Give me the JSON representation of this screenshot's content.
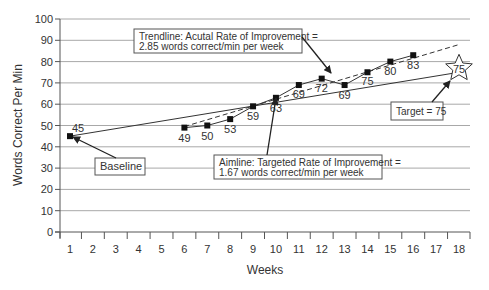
{
  "chart_data": {
    "type": "line",
    "title": "",
    "xlabel": "Weeks",
    "ylabel": "Words Correct Per Min",
    "ylim": [
      0,
      100
    ],
    "yticks": [
      0,
      10,
      20,
      30,
      40,
      50,
      60,
      70,
      80,
      90,
      100
    ],
    "xlim": [
      1,
      18
    ],
    "xticks": [
      1,
      2,
      3,
      4,
      5,
      6,
      7,
      8,
      9,
      10,
      11,
      12,
      13,
      14,
      15,
      16,
      17,
      18
    ],
    "grid": true,
    "series": [
      {
        "name": "Words Correct Per Min",
        "style": "solid line with square markers",
        "points": [
          {
            "x": 1,
            "y": 45,
            "label": "45"
          },
          {
            "x": 6,
            "y": 49,
            "label": "49"
          },
          {
            "x": 7,
            "y": 50,
            "label": "50"
          },
          {
            "x": 8,
            "y": 53,
            "label": "53"
          },
          {
            "x": 9,
            "y": 59,
            "label": "59"
          },
          {
            "x": 10,
            "y": 63,
            "label": "63"
          },
          {
            "x": 11,
            "y": 69,
            "label": "69"
          },
          {
            "x": 12,
            "y": 72,
            "label": "72"
          },
          {
            "x": 13,
            "y": 69,
            "label": "69"
          },
          {
            "x": 14,
            "y": 75,
            "label": "75"
          },
          {
            "x": 15,
            "y": 80,
            "label": "80"
          },
          {
            "x": 16,
            "y": 83,
            "label": "83"
          }
        ]
      },
      {
        "name": "Aimline",
        "style": "solid line",
        "points": [
          {
            "x": 1,
            "y": 45
          },
          {
            "x": 18,
            "y": 75
          }
        ]
      },
      {
        "name": "Trendline",
        "style": "dashed line",
        "points": [
          {
            "x": 6,
            "y": 49.5
          },
          {
            "x": 18,
            "y": 88
          }
        ]
      }
    ],
    "target": {
      "x": 18,
      "y": 75,
      "label": "75",
      "marker": "star"
    },
    "annotations": [
      {
        "id": "trendline",
        "lines": [
          "Trendline: Acutal Rate of Improvement =",
          "2.85 words correct/min per week"
        ]
      },
      {
        "id": "aimline",
        "lines": [
          "Aimline: Targeted Rate of Improvement =",
          "1.67 words correct/min per week"
        ]
      },
      {
        "id": "target",
        "lines": [
          "Target = 75"
        ]
      },
      {
        "id": "baseline",
        "lines": [
          "Baseline"
        ]
      }
    ]
  },
  "colors": {
    "grid": "#a8a8a8",
    "axis": "#555555",
    "line": "#333333",
    "marker": "#111111",
    "text": "#333333"
  }
}
